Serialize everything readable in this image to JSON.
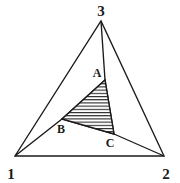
{
  "figure": {
    "kind": "geometry-diagram",
    "background_color": "#ffffff",
    "stroke_color": "#1a1a1a",
    "hatch_color": "#1a1a1a",
    "canvas": {
      "width": 180,
      "height": 183
    }
  },
  "outer_triangle": {
    "name": "outer-triangle",
    "vertices": [
      {
        "id": "v1",
        "label": "1",
        "x": 15,
        "y": 156,
        "label_x": 11,
        "label_y": 175
      },
      {
        "id": "v2",
        "label": "2",
        "x": 164,
        "y": 156,
        "label_x": 163,
        "label_y": 175
      },
      {
        "id": "v3",
        "label": "3",
        "x": 101,
        "y": 21,
        "label_x": 97,
        "label_y": 14
      }
    ],
    "path": "M 15 156 L 164 156 L 101 21 Z"
  },
  "inner_triangle": {
    "name": "inner-hatched-triangle",
    "vertices": [
      {
        "id": "pA",
        "label": "A",
        "x": 105,
        "y": 80,
        "label_x": 95,
        "label_y": 76
      },
      {
        "id": "pB",
        "label": "B",
        "x": 62,
        "y": 119,
        "label_x": 59,
        "label_y": 131
      },
      {
        "id": "pC",
        "label": "C",
        "x": 114,
        "y": 134,
        "label_x": 106,
        "label_y": 147
      }
    ],
    "path": "M 105 80 L 62 119 L 114 134 Z",
    "fill": "horizontal-hatch",
    "hatch_spacing_px": 3.2,
    "hatch_angle_deg": 0
  },
  "cevians": [
    {
      "name": "cevian-3-to-C-to-2-base",
      "from": "v3",
      "through": "pA",
      "to": "pC",
      "path": "M 101 21 L 105 80 L 114 134"
    },
    {
      "name": "cevian-1-to-B-to-C",
      "from": "v1",
      "through": "pB",
      "to": "pC",
      "path": "M 15 156 L 62 119 L 114 134"
    },
    {
      "name": "cevian-C-to-2",
      "from": "pC",
      "to": "v2",
      "path": "M 114 134 L 164 156"
    },
    {
      "name": "cevian-2-to-B-to-A-region",
      "from": "v2",
      "through": "pC",
      "to": "pA",
      "path": "M 164 156 L 114 134"
    },
    {
      "name": "cevian-B-to-A",
      "from": "pB",
      "to": "pA",
      "path": "M 62 119 L 105 80"
    }
  ],
  "labels": {
    "vertex_1": "1",
    "vertex_2": "2",
    "vertex_3": "3",
    "point_a": "A",
    "point_b": "B",
    "point_c": "C"
  }
}
